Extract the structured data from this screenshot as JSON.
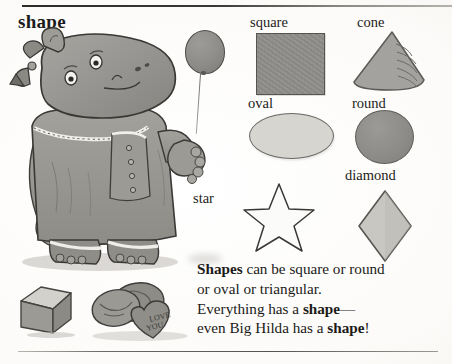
{
  "page": {
    "headword": "shape",
    "top_rule": true,
    "bottom_rule": true
  },
  "shapes": [
    {
      "key": "square",
      "label": "square",
      "fill": "#8e8d8a",
      "stroke": "#56544f"
    },
    {
      "key": "cone",
      "label": "cone",
      "fill": "#a3a29e",
      "stroke": "#5c5a56"
    },
    {
      "key": "oval",
      "label": "oval",
      "fill": "#d6d5d0",
      "stroke": "#6a6863"
    },
    {
      "key": "round",
      "label": "round",
      "fill": "#8c8b87",
      "stroke": "#5d5b57"
    },
    {
      "key": "diamond",
      "label": "diamond",
      "fill": "#c8c7c2",
      "stroke": "#585651"
    },
    {
      "key": "star",
      "label": "star",
      "fill": "#fbfbf9",
      "stroke": "#3a3834"
    }
  ],
  "illustration": {
    "character_name": "Big Hilda",
    "balloon": "balloon",
    "cube": "cube",
    "cookies": "cookies",
    "heart_cookie_text_line1": "LOVE",
    "heart_cookie_text_line2": "YOU"
  },
  "definition": {
    "lines": [
      {
        "bold_lead": "Shapes",
        "rest": " can be square or round"
      },
      {
        "bold_lead": "",
        "rest": "or oval or triangular."
      },
      {
        "bold_lead": "",
        "rest": "Everything has a ",
        "bold_tail": "shape",
        "tail_rest": "—"
      },
      {
        "bold_lead": "",
        "rest": "even Big Hilda has a ",
        "bold_tail": "shape",
        "tail_rest": "!"
      }
    ],
    "full_text": "Shapes can be square or round or oval or triangular. Everything has a shape—even Big Hilda has a shape!"
  }
}
